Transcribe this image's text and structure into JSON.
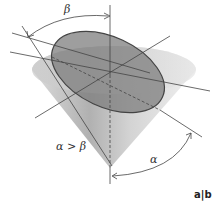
{
  "figure": {
    "labels": {
      "beta": "β",
      "alpha": "α",
      "condition": "α > β",
      "panel": "a|b"
    },
    "colors": {
      "cone_light": "#e6e6e6",
      "cone_dark": "#9a9a9a",
      "ellipse_fill": "#7a7a7a",
      "ellipse_stroke": "#4a4a4a",
      "line": "#444444"
    }
  }
}
